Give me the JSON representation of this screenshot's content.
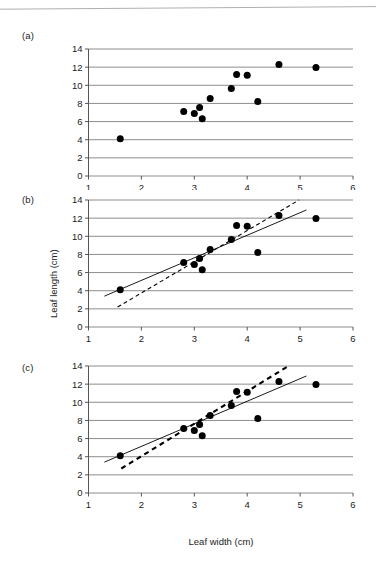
{
  "figure": {
    "panel_labels": [
      "(a)",
      "(b)",
      "(c)"
    ],
    "axis_x_label": "Leaf width (cm)",
    "axis_y_label": "Leaf length (cm)",
    "line_color": "#000000",
    "grid_color": "#808080",
    "point_color": "#000000"
  },
  "chart_data": [
    {
      "type": "scatter",
      "panel": "(a)",
      "title": "",
      "xlabel": "",
      "ylabel": "",
      "xlim": [
        1,
        6
      ],
      "ylim": [
        0,
        14
      ],
      "xticks": [
        1,
        2,
        3,
        4,
        5,
        6
      ],
      "yticks": [
        0,
        2,
        4,
        6,
        8,
        10,
        12,
        14
      ],
      "grid": "horizontal",
      "legend": "none",
      "series": [
        {
          "name": "Leaf measurements",
          "x": [
            1.6,
            2.8,
            3.0,
            3.1,
            3.15,
            3.3,
            3.7,
            3.8,
            4.0,
            4.2,
            4.6,
            5.3
          ],
          "y": [
            4.1,
            7.1,
            6.9,
            7.55,
            6.3,
            8.55,
            9.65,
            11.2,
            11.1,
            8.2,
            12.3,
            11.95
          ]
        }
      ],
      "fit_lines": []
    },
    {
      "type": "scatter",
      "panel": "(b)",
      "title": "",
      "xlabel": "",
      "ylabel": "Leaf length (cm)",
      "xlim": [
        1,
        6
      ],
      "ylim": [
        0,
        14
      ],
      "xticks": [
        1,
        2,
        3,
        4,
        5,
        6
      ],
      "yticks": [
        0,
        2,
        4,
        6,
        8,
        10,
        12,
        14
      ],
      "grid": "horizontal",
      "legend": "none",
      "series": [
        {
          "name": "Leaf measurements",
          "x": [
            1.6,
            2.8,
            3.0,
            3.1,
            3.15,
            3.3,
            3.7,
            3.8,
            4.0,
            4.2,
            4.6,
            5.3
          ],
          "y": [
            4.1,
            7.1,
            6.9,
            7.55,
            6.3,
            8.55,
            9.65,
            11.2,
            11.1,
            8.2,
            12.3,
            11.95
          ]
        }
      ],
      "fit_lines": [
        {
          "name": "solid-fit",
          "style": "solid",
          "width": 0.9,
          "x_start": 1.3,
          "y_start": 3.4,
          "x_end": 5.12,
          "y_end": 12.9
        },
        {
          "name": "dashed-fit",
          "style": "dashed",
          "width": 1.1,
          "x_start": 1.55,
          "y_start": 2.2,
          "x_end": 4.98,
          "y_end": 14.0
        }
      ]
    },
    {
      "type": "scatter",
      "panel": "(c)",
      "title": "",
      "xlabel": "Leaf width (cm)",
      "ylabel": "",
      "xlim": [
        1,
        6
      ],
      "ylim": [
        0,
        14
      ],
      "xticks": [
        1,
        2,
        3,
        4,
        5,
        6
      ],
      "yticks": [
        0,
        2,
        4,
        6,
        8,
        10,
        12,
        14
      ],
      "grid": "horizontal",
      "legend": "none",
      "series": [
        {
          "name": "Leaf measurements",
          "x": [
            1.6,
            2.8,
            3.0,
            3.1,
            3.15,
            3.3,
            3.7,
            3.8,
            4.0,
            4.2,
            4.6,
            5.3
          ],
          "y": [
            4.1,
            7.1,
            6.9,
            7.55,
            6.3,
            8.55,
            9.65,
            11.2,
            11.1,
            8.2,
            12.3,
            11.95
          ]
        }
      ],
      "fit_lines": [
        {
          "name": "solid-fit",
          "style": "solid",
          "width": 0.9,
          "x_start": 1.3,
          "y_start": 3.4,
          "x_end": 5.12,
          "y_end": 12.9
        },
        {
          "name": "dashed-fit",
          "style": "dashed-thick",
          "width": 2.1,
          "x_start": 1.62,
          "y_start": 2.7,
          "x_end": 4.78,
          "y_end": 14.0
        }
      ]
    }
  ]
}
